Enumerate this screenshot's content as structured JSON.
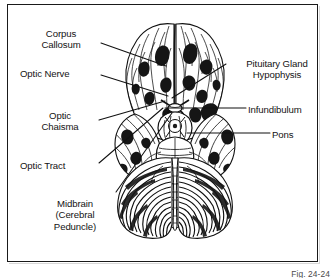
{
  "figure": {
    "title_caption": "Fig. 24-24",
    "frame_color": "#1a1a1a",
    "ink_color": "#131313",
    "background_color": "#ffffff"
  },
  "labels_left": [
    {
      "id": "corpus-callosum",
      "text": "Corpus\nCallosum",
      "x": 22,
      "y": 28,
      "align": "center",
      "width": 78
    },
    {
      "id": "optic-nerve",
      "text": "Optic Nerve",
      "x": 20,
      "y": 68,
      "align": "left",
      "width": 80
    },
    {
      "id": "optic-chiasma",
      "text": "Optic\nChaisma",
      "x": 22,
      "y": 110,
      "align": "center",
      "width": 76
    },
    {
      "id": "optic-tract",
      "text": "Optic Tract",
      "x": 20,
      "y": 160,
      "align": "left",
      "width": 78
    },
    {
      "id": "midbrain",
      "text": "Midbrain\n(Cerebral\nPeduncle)",
      "x": 34,
      "y": 198,
      "align": "center",
      "width": 82
    }
  ],
  "labels_right": [
    {
      "id": "pituitary-gland",
      "text": "Pituitary Gland\nHypophysis",
      "x": 228,
      "y": 58,
      "align": "center",
      "width": 98
    },
    {
      "id": "infundibulum",
      "text": "Infundibulum",
      "x": 248,
      "y": 104,
      "align": "left",
      "width": 80
    },
    {
      "id": "pons",
      "text": "Pons",
      "x": 272,
      "y": 129,
      "align": "left",
      "width": 40
    }
  ],
  "leader_lines": [
    {
      "id": "leader-corpus-callosum",
      "from": [
        101,
        43
      ],
      "to": [
        166,
        66
      ]
    },
    {
      "id": "leader-optic-nerve",
      "from": [
        101,
        75
      ],
      "to": [
        168,
        96
      ]
    },
    {
      "id": "leader-optic-chiasma",
      "from": [
        99,
        120
      ],
      "to": [
        165,
        101
      ]
    },
    {
      "id": "leader-optic-tract",
      "from": [
        99,
        163
      ],
      "to": [
        163,
        108
      ]
    },
    {
      "id": "leader-midbrain",
      "from": [
        116,
        192
      ],
      "to": [
        172,
        113
      ]
    },
    {
      "id": "leader-pituitary-gland",
      "from": [
        226,
        64
      ],
      "to": [
        172,
        98
      ]
    },
    {
      "id": "leader-infundibulum",
      "from": [
        246,
        108
      ],
      "to": [
        165,
        108
      ]
    },
    {
      "id": "leader-pons",
      "from": [
        270,
        133
      ],
      "to": [
        187,
        133
      ]
    }
  ]
}
